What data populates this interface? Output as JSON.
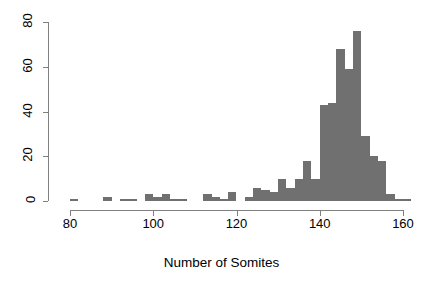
{
  "chart_data": {
    "type": "bar",
    "title": "",
    "xlabel": "Number of Somites",
    "ylabel": "",
    "xlim": [
      78,
      165
    ],
    "ylim": [
      0,
      80
    ],
    "grid": false,
    "legend": null,
    "bin_width": 2,
    "bar_color": "#707070",
    "axis_color": "#808080",
    "x_ticks": [
      80,
      100,
      120,
      140,
      160
    ],
    "x_tick_labels": [
      "80",
      "100",
      "120",
      "140",
      "160"
    ],
    "y_ticks": [
      0,
      20,
      40,
      60,
      80
    ],
    "y_tick_labels": [
      "0",
      "20",
      "40",
      "60",
      "80"
    ],
    "categories": [
      81,
      83,
      85,
      87,
      89,
      91,
      93,
      95,
      97,
      99,
      101,
      103,
      105,
      107,
      109,
      111,
      113,
      115,
      117,
      119,
      121,
      123,
      125,
      127,
      129,
      131,
      133,
      135,
      137,
      139,
      141,
      143,
      145,
      147,
      149,
      151,
      153,
      155,
      157,
      159,
      161,
      163
    ],
    "values": [
      1,
      0,
      0,
      0,
      2,
      0,
      1,
      1,
      0,
      3,
      2,
      3,
      1,
      1,
      0,
      0,
      3,
      2,
      1,
      4,
      0,
      2,
      6,
      5,
      4,
      10,
      6,
      10,
      18,
      10,
      43,
      44,
      68,
      59,
      76,
      29,
      20,
      18,
      3,
      1,
      1,
      0
    ]
  },
  "figure": {
    "x_axis_title": "Number of Somites"
  }
}
